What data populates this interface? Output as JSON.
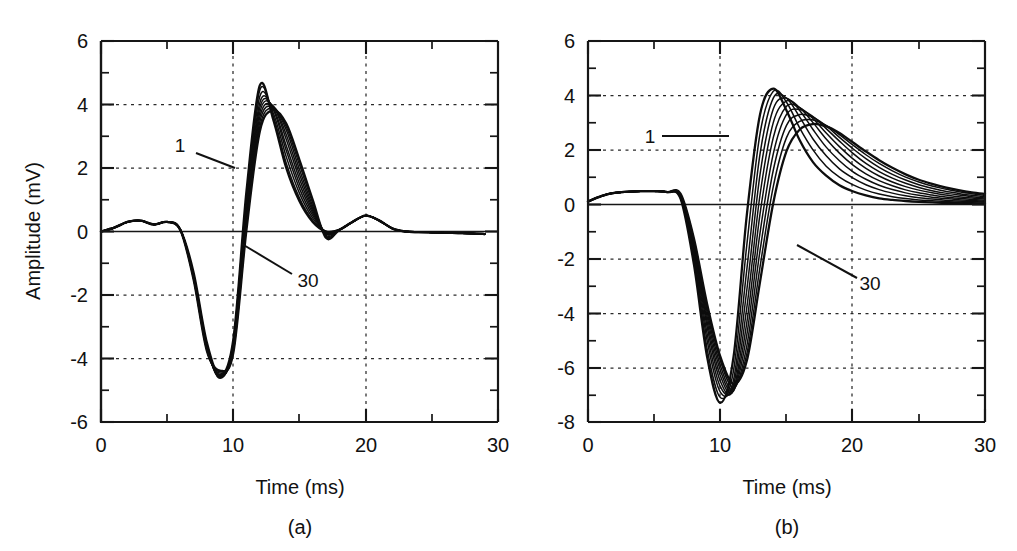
{
  "figure": {
    "background_color": "#ffffff",
    "line_color": "#0d0d0d",
    "panels": [
      "a",
      "b"
    ]
  },
  "panel_a": {
    "caption": "(a)",
    "xlabel": "Time (ms)",
    "ylabel": "Amplitude (mV)",
    "x_ticks": [
      "0",
      "10",
      "20",
      "30"
    ],
    "y_ticks": [
      "6",
      "4",
      "2",
      "0",
      "-2",
      "-4",
      "-6"
    ],
    "label_first": "1",
    "label_last": "30"
  },
  "panel_b": {
    "caption": "(b)",
    "xlabel": "Time (ms)",
    "ylabel": "",
    "x_ticks": [
      "0",
      "10",
      "20",
      "30"
    ],
    "y_ticks": [
      "6",
      "4",
      "2",
      "0",
      "-2",
      "-4",
      "-6",
      "-8"
    ],
    "label_first": "1",
    "label_last": "30"
  },
  "chart_data": [
    {
      "type": "line",
      "panel": "a",
      "title": "",
      "xlabel": "Time (ms)",
      "ylabel": "Amplitude (mV)",
      "xlim": [
        0,
        30
      ],
      "ylim": [
        -6,
        6
      ],
      "x_major_ticks": [
        0,
        10,
        20,
        30
      ],
      "x_minor_ticks": [
        5,
        15,
        25
      ],
      "y_major_ticks": [
        -6,
        -4,
        -2,
        0,
        2,
        4,
        6
      ],
      "y_minor_ticks": [
        -5,
        -3,
        -1,
        1,
        3,
        5
      ],
      "grid": "dotted gridlines at x=10,20 and y=-4,-2,2,4",
      "legend": "none; traces annotated 1 (earliest) and 30 (latest)",
      "annotations": [
        {
          "text": "1",
          "x": 6.6,
          "y": 2.6,
          "leader_to": [
            9.0,
            2.0
          ]
        },
        {
          "text": "30",
          "x": 13.6,
          "y": -2.45,
          "leader_to": [
            10.6,
            -0.6
          ]
        }
      ],
      "n_traces": 10,
      "trace_index_range": [
        1,
        30
      ],
      "x_samples": [
        0,
        1,
        2,
        3,
        4,
        5,
        6,
        7,
        8,
        9,
        10,
        11,
        12,
        13,
        14,
        15,
        16,
        17,
        18,
        19,
        20,
        21,
        22,
        23,
        24,
        25,
        26,
        27,
        28,
        29
      ],
      "series": [
        {
          "name": "1",
          "values": [
            0.0,
            0.12,
            0.3,
            0.34,
            0.22,
            0.3,
            0.05,
            -1.3,
            -3.5,
            -4.55,
            -3.4,
            1.3,
            4.6,
            3.55,
            2.0,
            0.95,
            0.3,
            0.0,
            0.05,
            0.3,
            0.5,
            0.35,
            0.1,
            0.0,
            -0.02,
            -0.03,
            -0.04,
            -0.05,
            -0.06,
            -0.08
          ]
        },
        {
          "name": "4",
          "values": [
            0.0,
            0.12,
            0.3,
            0.34,
            0.22,
            0.3,
            0.05,
            -1.35,
            -3.55,
            -4.6,
            -3.45,
            1.15,
            4.45,
            3.65,
            2.15,
            1.05,
            0.35,
            0.0,
            0.05,
            0.3,
            0.5,
            0.35,
            0.1,
            0.0,
            -0.02,
            -0.03,
            -0.04,
            -0.05,
            -0.06,
            -0.08
          ]
        },
        {
          "name": "7",
          "values": [
            0.0,
            0.12,
            0.3,
            0.34,
            0.22,
            0.3,
            0.05,
            -1.38,
            -3.6,
            -4.62,
            -3.5,
            1.0,
            4.25,
            3.75,
            2.35,
            1.2,
            0.42,
            0.0,
            0.05,
            0.3,
            0.5,
            0.35,
            0.1,
            0.0,
            -0.02,
            -0.03,
            -0.04,
            -0.05,
            -0.06,
            -0.08
          ]
        },
        {
          "name": "10",
          "values": [
            0.0,
            0.12,
            0.3,
            0.34,
            0.22,
            0.3,
            0.05,
            -1.4,
            -3.62,
            -4.6,
            -3.55,
            0.85,
            4.05,
            3.85,
            2.55,
            1.35,
            0.5,
            -0.02,
            0.05,
            0.3,
            0.5,
            0.35,
            0.1,
            0.0,
            -0.02,
            -0.03,
            -0.04,
            -0.05,
            -0.06,
            -0.08
          ]
        },
        {
          "name": "13",
          "values": [
            0.0,
            0.12,
            0.3,
            0.34,
            0.22,
            0.3,
            0.05,
            -1.42,
            -3.65,
            -4.58,
            -3.6,
            0.7,
            3.9,
            3.9,
            2.7,
            1.5,
            0.58,
            -0.04,
            0.05,
            0.3,
            0.5,
            0.35,
            0.1,
            0.0,
            -0.02,
            -0.03,
            -0.04,
            -0.05,
            -0.06,
            -0.08
          ]
        },
        {
          "name": "16",
          "values": [
            0.0,
            0.12,
            0.3,
            0.34,
            0.22,
            0.3,
            0.05,
            -1.44,
            -3.67,
            -4.55,
            -3.65,
            0.55,
            3.75,
            3.95,
            2.9,
            1.65,
            0.65,
            -0.06,
            0.05,
            0.3,
            0.5,
            0.35,
            0.1,
            0.0,
            -0.02,
            -0.03,
            -0.04,
            -0.05,
            -0.06,
            -0.08
          ]
        },
        {
          "name": "19",
          "values": [
            0.0,
            0.12,
            0.3,
            0.34,
            0.22,
            0.3,
            0.05,
            -1.46,
            -3.7,
            -4.5,
            -3.7,
            0.42,
            3.6,
            3.95,
            3.05,
            1.8,
            0.72,
            -0.08,
            0.05,
            0.3,
            0.5,
            0.35,
            0.1,
            0.0,
            -0.02,
            -0.03,
            -0.04,
            -0.05,
            -0.06,
            -0.08
          ]
        },
        {
          "name": "22",
          "values": [
            0.0,
            0.12,
            0.3,
            0.34,
            0.22,
            0.3,
            0.05,
            -1.48,
            -3.72,
            -4.46,
            -3.74,
            0.3,
            3.45,
            3.92,
            3.2,
            1.95,
            0.8,
            -0.12,
            0.05,
            0.3,
            0.5,
            0.35,
            0.1,
            0.0,
            -0.02,
            -0.03,
            -0.04,
            -0.05,
            -0.06,
            -0.08
          ]
        },
        {
          "name": "26",
          "values": [
            0.0,
            0.12,
            0.3,
            0.34,
            0.22,
            0.3,
            0.05,
            -1.5,
            -3.74,
            -4.42,
            -3.78,
            0.18,
            3.3,
            3.88,
            3.3,
            2.1,
            0.9,
            -0.15,
            0.05,
            0.3,
            0.5,
            0.35,
            0.1,
            0.0,
            -0.02,
            -0.03,
            -0.04,
            -0.05,
            -0.06,
            -0.08
          ]
        },
        {
          "name": "30",
          "values": [
            0.0,
            0.12,
            0.3,
            0.34,
            0.22,
            0.3,
            0.05,
            -1.52,
            -3.76,
            -4.38,
            -3.82,
            0.08,
            3.15,
            3.82,
            3.4,
            2.25,
            1.0,
            -0.2,
            0.05,
            0.3,
            0.5,
            0.35,
            0.1,
            0.0,
            -0.02,
            -0.03,
            -0.04,
            -0.05,
            -0.06,
            -0.08
          ]
        }
      ],
      "description": "Family of 10 overlapping biphasic waveforms. Small positive ripple 0-6 ms (~0.3 mV), sharp negative trough ~-4.4 to -4.6 mV near 9 ms, sharp positive peak 3.1-4.6 mV between 12 and 14 ms, decay to baseline by 17 ms, low positive bump ~0.5 mV near 20 ms, flat to 29 ms."
    },
    {
      "type": "line",
      "panel": "b",
      "title": "",
      "xlabel": "Time (ms)",
      "ylabel": "Amplitude (mV)",
      "xlim": [
        0,
        30
      ],
      "ylim": [
        -8,
        6
      ],
      "x_major_ticks": [
        0,
        10,
        20,
        30
      ],
      "x_minor_ticks": [
        5,
        15,
        25
      ],
      "y_major_ticks": [
        -8,
        -6,
        -4,
        -2,
        0,
        2,
        4,
        6
      ],
      "y_minor_ticks": [
        -7,
        -5,
        -3,
        -1,
        1,
        3,
        5
      ],
      "grid": "dotted gridlines at x=10,20 and y=-6,-4,-2,2,4",
      "legend": "none; traces annotated 1 (earliest) and 30 (latest)",
      "annotations": [
        {
          "text": "1",
          "x": 6.2,
          "y": 2.65,
          "leader_to": [
            10.6,
            2.65
          ]
        },
        {
          "text": "30",
          "x": 21.3,
          "y": -3.1,
          "leader_to": [
            16.0,
            -1.5
          ]
        }
      ],
      "n_traces": 10,
      "trace_index_range": [
        1,
        30
      ],
      "x_samples": [
        0,
        1,
        2,
        3,
        4,
        5,
        6,
        7,
        8,
        9,
        10,
        11,
        12,
        13,
        14,
        15,
        16,
        17,
        18,
        19,
        20,
        21,
        22,
        23,
        24,
        25,
        26,
        27,
        28,
        29,
        30
      ],
      "series": [
        {
          "name": "1",
          "values": [
            0.1,
            0.3,
            0.42,
            0.46,
            0.48,
            0.48,
            0.45,
            0.2,
            -2.2,
            -5.6,
            -7.3,
            -5.6,
            -0.4,
            3.3,
            4.25,
            3.45,
            2.35,
            1.55,
            1.05,
            0.7,
            0.48,
            0.33,
            0.22,
            0.16,
            0.12,
            0.09,
            0.07,
            0.05,
            0.04,
            0.03,
            0.02
          ]
        },
        {
          "name": "4",
          "values": [
            0.1,
            0.3,
            0.42,
            0.46,
            0.48,
            0.48,
            0.45,
            0.22,
            -2.0,
            -5.3,
            -7.1,
            -6.1,
            -1.5,
            2.6,
            4.15,
            3.75,
            2.8,
            2.0,
            1.4,
            1.0,
            0.72,
            0.52,
            0.38,
            0.28,
            0.21,
            0.16,
            0.13,
            0.1,
            0.08,
            0.06,
            0.05
          ]
        },
        {
          "name": "7",
          "values": [
            0.1,
            0.3,
            0.42,
            0.46,
            0.48,
            0.48,
            0.45,
            0.24,
            -1.85,
            -5.0,
            -6.9,
            -6.45,
            -2.4,
            1.85,
            3.9,
            3.9,
            3.2,
            2.4,
            1.78,
            1.3,
            0.97,
            0.72,
            0.54,
            0.41,
            0.31,
            0.24,
            0.19,
            0.15,
            0.12,
            0.1,
            0.08
          ]
        },
        {
          "name": "10",
          "values": [
            0.1,
            0.3,
            0.42,
            0.46,
            0.48,
            0.48,
            0.45,
            0.26,
            -1.7,
            -4.75,
            -6.7,
            -6.65,
            -3.15,
            1.1,
            3.5,
            3.9,
            3.45,
            2.75,
            2.1,
            1.6,
            1.2,
            0.92,
            0.7,
            0.54,
            0.42,
            0.33,
            0.26,
            0.21,
            0.17,
            0.14,
            0.11
          ]
        },
        {
          "name": "13",
          "values": [
            0.1,
            0.3,
            0.42,
            0.46,
            0.48,
            0.48,
            0.45,
            0.28,
            -1.6,
            -4.5,
            -6.5,
            -6.8,
            -3.8,
            0.35,
            3.0,
            3.8,
            3.55,
            3.0,
            2.4,
            1.88,
            1.45,
            1.12,
            0.87,
            0.68,
            0.53,
            0.42,
            0.34,
            0.27,
            0.22,
            0.18,
            0.15
          ]
        },
        {
          "name": "16",
          "values": [
            0.1,
            0.3,
            0.42,
            0.46,
            0.48,
            0.48,
            0.45,
            0.3,
            -1.5,
            -4.3,
            -6.3,
            -6.85,
            -4.35,
            -0.35,
            2.45,
            3.6,
            3.55,
            3.15,
            2.62,
            2.12,
            1.68,
            1.32,
            1.04,
            0.82,
            0.65,
            0.52,
            0.42,
            0.34,
            0.28,
            0.23,
            0.19
          ]
        },
        {
          "name": "19",
          "values": [
            0.1,
            0.3,
            0.42,
            0.46,
            0.48,
            0.48,
            0.45,
            0.32,
            -1.42,
            -4.12,
            -6.1,
            -6.85,
            -4.8,
            -1.05,
            1.85,
            3.3,
            3.48,
            3.22,
            2.78,
            2.32,
            1.88,
            1.5,
            1.2,
            0.96,
            0.77,
            0.62,
            0.5,
            0.41,
            0.34,
            0.28,
            0.23
          ]
        },
        {
          "name": "22",
          "values": [
            0.1,
            0.3,
            0.42,
            0.46,
            0.48,
            0.48,
            0.45,
            0.34,
            -1.35,
            -3.95,
            -5.92,
            -6.8,
            -5.2,
            -1.7,
            1.25,
            2.9,
            3.3,
            3.2,
            2.88,
            2.46,
            2.05,
            1.68,
            1.36,
            1.1,
            0.89,
            0.72,
            0.59,
            0.48,
            0.4,
            0.33,
            0.28
          ]
        },
        {
          "name": "26",
          "values": [
            0.1,
            0.3,
            0.42,
            0.46,
            0.48,
            0.48,
            0.45,
            0.36,
            -1.3,
            -3.8,
            -5.75,
            -6.72,
            -5.5,
            -2.3,
            0.65,
            2.45,
            3.05,
            3.1,
            2.9,
            2.56,
            2.18,
            1.82,
            1.5,
            1.23,
            1.0,
            0.82,
            0.67,
            0.56,
            0.46,
            0.39,
            0.33
          ]
        },
        {
          "name": "30",
          "values": [
            0.1,
            0.3,
            0.42,
            0.46,
            0.48,
            0.48,
            0.45,
            0.38,
            -1.25,
            -3.66,
            -5.6,
            -6.6,
            -5.75,
            -2.85,
            0.05,
            1.95,
            2.75,
            2.95,
            2.86,
            2.62,
            2.28,
            1.94,
            1.62,
            1.34,
            1.1,
            0.9,
            0.75,
            0.62,
            0.52,
            0.44,
            0.38
          ]
        }
      ],
      "description": "Family of 10 overlapping biphasic waveforms with longer tails. Broad low positive plateau ~0.45 mV from 0-7 ms, deep negative trough -5.6 to -7.3 mV near 10-12 ms, positive peak 2.75-4.25 mV spread from 14 to 18 ms, slow monotonic decay to 0.02-0.38 mV at 30 ms."
    }
  ]
}
